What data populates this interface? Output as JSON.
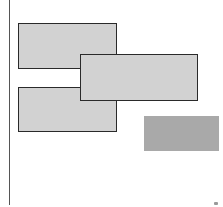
{
  "diagram": {
    "background": "#ffffff",
    "axis_line": {
      "x": 9,
      "y": 0,
      "height": 205,
      "color": "#555555"
    },
    "boxes": [
      {
        "id": "box-top-left",
        "x": 18,
        "y": 23,
        "w": 99,
        "h": 46,
        "fill": "#d2d2d2",
        "stroke": "#2a2a2a"
      },
      {
        "id": "box-bottom-left",
        "x": 18,
        "y": 87,
        "w": 99,
        "h": 45,
        "fill": "#d2d2d2",
        "stroke": "#2a2a2a"
      },
      {
        "id": "box-middle-right",
        "x": 80,
        "y": 54,
        "w": 118,
        "h": 47,
        "fill": "#d2d2d2",
        "stroke": "#2a2a2a"
      }
    ],
    "filled_block": {
      "x": 144,
      "y": 116,
      "w": 75,
      "h": 35,
      "fill": "#a9a9a9"
    }
  }
}
